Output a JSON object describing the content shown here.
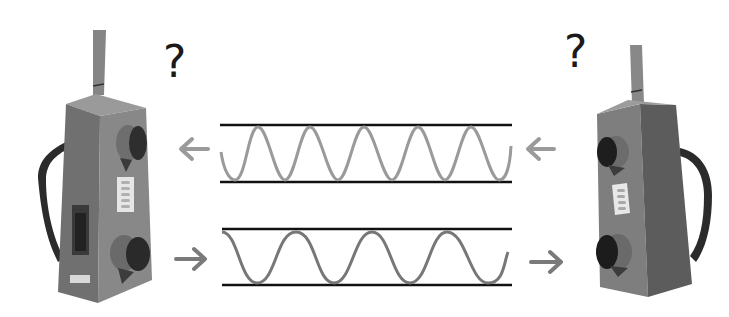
{
  "diagram": {
    "left_device": {
      "label": "walkie-talkie-left",
      "question_mark": "?",
      "body_color": "#7a7a7a",
      "side_color": "#6a6a6a",
      "strap_color": "#2a2a2a"
    },
    "right_device": {
      "label": "walkie-talkie-right",
      "question_mark": "?",
      "body_color": "#808080",
      "side_color": "#5e5e5e",
      "strap_color": "#2a2a2a"
    },
    "channels": [
      {
        "name": "top-channel",
        "direction": "right-to-left",
        "wave_color": "#9a9a9a",
        "cycles": 5,
        "line_color": "#111111",
        "arrow_color": "#9a9a9a"
      },
      {
        "name": "bottom-channel",
        "direction": "left-to-right",
        "wave_color": "#7a7a7a",
        "cycles": 3.5,
        "line_color": "#111111",
        "arrow_color": "#7a7a7a"
      }
    ]
  }
}
